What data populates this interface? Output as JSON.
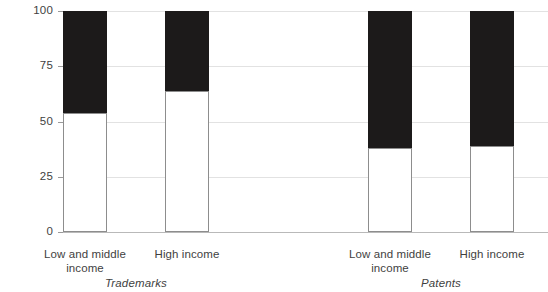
{
  "chart_data": {
    "type": "bar",
    "subtype": "stacked-100-percent",
    "title": "",
    "subtitle": "",
    "xlabel": "",
    "ylabel": "",
    "ylim": [
      0,
      100
    ],
    "ytick_labels": [
      "100",
      "75",
      "50",
      "25",
      "0"
    ],
    "ytick_values": [
      100,
      75,
      50,
      25,
      0
    ],
    "grid": true,
    "legend": "none",
    "categories": [
      "Low and middle income",
      "High income",
      "Low and middle income",
      "High income"
    ],
    "groups": [
      {
        "label": "Trademarks",
        "categories": [
          "Low and middle income",
          "High income"
        ],
        "light_values": [
          54,
          64
        ],
        "dark_values": [
          46,
          36
        ]
      },
      {
        "label": "Patents",
        "categories": [
          "Low and middle income",
          "High income"
        ],
        "light_values": [
          38,
          39
        ],
        "dark_values": [
          62,
          61
        ]
      }
    ],
    "series": [
      {
        "name": "lower-segment",
        "fill": "#ffffff",
        "values": [
          54,
          64,
          38,
          39
        ]
      },
      {
        "name": "upper-segment",
        "fill": "#1c1a1a",
        "values": [
          46,
          36,
          62,
          61
        ]
      }
    ],
    "bars": [
      {
        "id": "bar-1",
        "category": "Low and middle income",
        "group": "Trademarks",
        "light": 54,
        "dark": 46
      },
      {
        "id": "bar-2",
        "category": "High income",
        "group": "Trademarks",
        "light": 64,
        "dark": 36
      },
      {
        "id": "bar-3",
        "category": "Low and middle income",
        "group": "Patents",
        "light": 38,
        "dark": 62
      },
      {
        "id": "bar-4",
        "category": "High income",
        "group": "Patents",
        "light": 39,
        "dark": 61
      }
    ]
  },
  "axis": {
    "ticks": [
      {
        "label": "100",
        "value": 100
      },
      {
        "label": "75",
        "value": 75
      },
      {
        "label": "50",
        "value": 50
      },
      {
        "label": "25",
        "value": 25
      },
      {
        "label": "0",
        "value": 0
      }
    ]
  },
  "xlabels": [
    {
      "line1": "Low and middle",
      "line2": "income"
    },
    {
      "line1": "High income",
      "line2": ""
    },
    {
      "line1": "Low and middle",
      "line2": "income"
    },
    {
      "line1": "High income",
      "line2": ""
    }
  ],
  "group_labels": [
    "Trademarks",
    "Patents"
  ],
  "colors": {
    "dark_segment": "#1c1a1a",
    "light_segment": "#ffffff",
    "bar_outline": "#8d8d8d",
    "gridline": "#e2e2e2",
    "axis_line": "#9a9a9a",
    "baseline": "#b9b9b9",
    "text": "#3f3f3f",
    "background": "#ffffff"
  }
}
